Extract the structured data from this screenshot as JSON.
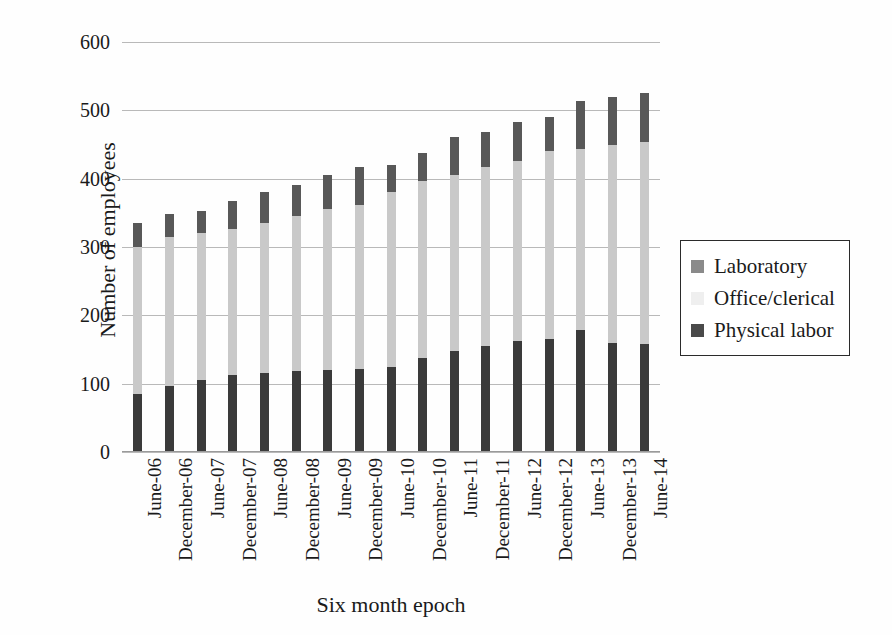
{
  "chart_data": {
    "type": "bar",
    "subtype": "stacked-column",
    "title": "",
    "xlabel": "Six month epoch",
    "ylabel": "Number of employees",
    "ylim": [
      0,
      600
    ],
    "yticks": [
      0,
      100,
      200,
      300,
      400,
      500,
      600
    ],
    "grid": true,
    "legend_position": "right",
    "categories": [
      "June-06",
      "December-06",
      "June-07",
      "December-07",
      "June-08",
      "December-08",
      "June-09",
      "December-09",
      "June-10",
      "December-10",
      "June-11",
      "December-11",
      "June-12",
      "December-12",
      "June-13",
      "December-13",
      "June-14"
    ],
    "series": [
      {
        "name": "Physical labor",
        "color": "#3a3a3a",
        "values": [
          85,
          97,
          105,
          112,
          115,
          118,
          120,
          122,
          125,
          138,
          148,
          155,
          163,
          165,
          178,
          160,
          158
        ]
      },
      {
        "name": "Office/clerical",
        "color": "#c9c9c9",
        "values": [
          215,
          218,
          215,
          215,
          220,
          228,
          235,
          240,
          255,
          258,
          258,
          262,
          263,
          275,
          265,
          290,
          295
        ]
      },
      {
        "name": "Laboratory",
        "color": "#585858",
        "values": [
          35,
          33,
          33,
          40,
          45,
          45,
          50,
          55,
          40,
          42,
          55,
          52,
          57,
          50,
          70,
          70,
          72
        ]
      }
    ],
    "totals": [
      335,
      348,
      353,
      367,
      380,
      391,
      405,
      417,
      420,
      438,
      461,
      469,
      483,
      490,
      513,
      520,
      525
    ]
  },
  "legend": {
    "items": [
      {
        "label": "Laboratory",
        "swatch": "laboratory-swatch"
      },
      {
        "label": "Office/clerical",
        "swatch": "office-clerical-swatch"
      },
      {
        "label": "Physical labor",
        "swatch": "physical-labor-swatch"
      }
    ]
  }
}
